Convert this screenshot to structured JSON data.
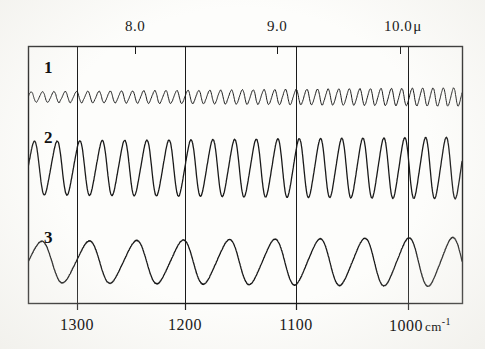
{
  "figure": {
    "kind": "ir-transmission-fringe-spectrum",
    "background_color": "#fdfdfb",
    "ink_color": "#1a1a1a"
  },
  "top_axis": {
    "name": "wavelength-axis",
    "unit_symbol": "μ",
    "ticks": [
      {
        "label": "8.0",
        "value": 8.0,
        "x": 135
      },
      {
        "label": "9.0",
        "value": 9.0,
        "x": 277
      },
      {
        "label": "10.0",
        "value": 10.0,
        "x": 400
      }
    ]
  },
  "bottom_axis": {
    "name": "wavenumber-axis",
    "unit_label": "cm",
    "unit_exponent": "-1",
    "ticks": [
      {
        "label": "1300",
        "value": 1300,
        "x": 77
      },
      {
        "label": "1200",
        "value": 1200,
        "x": 185
      },
      {
        "label": "1100",
        "value": 1100,
        "x": 296
      },
      {
        "label": "1000",
        "value": 1000,
        "x": 408
      }
    ]
  },
  "plot_frame": {
    "left": 28,
    "right": 462,
    "top": 46,
    "bottom": 303
  },
  "gridlines_x": [
    77,
    185,
    296,
    408
  ],
  "series_labels": [
    {
      "text": "1",
      "x": 44,
      "y": 58
    },
    {
      "text": "2",
      "x": 44,
      "y": 128
    },
    {
      "text": "3",
      "x": 44,
      "y": 228
    }
  ],
  "chart_data": {
    "type": "line",
    "title": "",
    "subtitle": "",
    "xlabel": "",
    "ylabel": "",
    "grid": true,
    "legend_position": "inline-left",
    "x_axis_primary": {
      "name": "wavenumber",
      "unit": "cm^-1",
      "direction": "decreasing-left-to-right",
      "tick_values": [
        1300,
        1200,
        1100,
        1000
      ],
      "tick_labels": [
        "1300",
        "1200",
        "1100",
        "1000"
      ],
      "range": [
        1345,
        962
      ]
    },
    "x_axis_secondary": {
      "name": "wavelength",
      "unit": "micron",
      "tick_values": [
        8.0,
        9.0,
        10.0
      ],
      "tick_labels": [
        "8.0",
        "9.0",
        "10.0"
      ],
      "range": [
        7.44,
        10.4
      ]
    },
    "y_axis": {
      "name": "transmission",
      "unit": "arbitrary",
      "tick_values": [],
      "tick_labels": [],
      "visible_ticks": false
    },
    "series": [
      {
        "name": "1",
        "label": "1",
        "description": "high-frequency low-amplitude interference fringes",
        "baseline_y": 97,
        "fringe_count": 38,
        "amplitude_start": 5.0,
        "amplitude_end": 9.0,
        "stroke_width": 1.0
      },
      {
        "name": "2",
        "label": "2",
        "description": "medium-frequency large-amplitude interference fringes",
        "baseline_y": 168,
        "fringe_count": 19,
        "amplitude_start": 26.0,
        "amplitude_end": 30.0,
        "stroke_width": 1.3
      },
      {
        "name": "3",
        "label": "3",
        "description": "low-frequency moderate-amplitude interference fringes",
        "baseline_y": 262,
        "fringe_count": 9,
        "amplitude_start": 20.0,
        "amplitude_end": 24.0,
        "stroke_width": 1.3
      }
    ]
  }
}
